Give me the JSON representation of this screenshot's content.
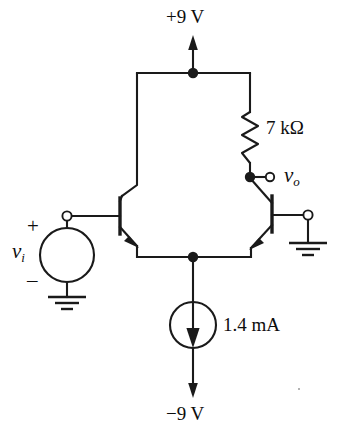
{
  "figure": {
    "type": "circuit-schematic",
    "background_color": "#ffffff",
    "line_color": "#1a1a1a"
  },
  "labels": {
    "supply_positive": "+9 V",
    "supply_negative": "−9 V",
    "resistor_value": "7 kΩ",
    "current_source_value": "1.4 mA",
    "input_symbol": "v",
    "input_subscript": "i",
    "output_symbol": "v",
    "output_subscript": "o",
    "polarity_plus": "+",
    "polarity_minus": "–"
  },
  "components": [
    {
      "name": "positive-supply-rail",
      "kind": "supply-arrow",
      "label": "+9 V",
      "direction": "up"
    },
    {
      "name": "load-resistor",
      "kind": "resistor",
      "label": "7 kΩ",
      "orientation": "vertical"
    },
    {
      "name": "transistor-q1",
      "kind": "npn-bjt",
      "position": "left"
    },
    {
      "name": "transistor-q2",
      "kind": "npn-bjt",
      "position": "right"
    },
    {
      "name": "input-voltage-source",
      "kind": "voltage-source",
      "label": "v_i",
      "polarity_top": "+",
      "polarity_bottom": "–"
    },
    {
      "name": "tail-current-source",
      "kind": "current-source",
      "label": "1.4 mA",
      "direction": "down"
    },
    {
      "name": "negative-supply-rail",
      "kind": "supply-arrow",
      "label": "−9 V",
      "direction": "down"
    },
    {
      "name": "output-terminal",
      "kind": "terminal",
      "label": "v_o"
    },
    {
      "name": "source-ground",
      "kind": "ground"
    },
    {
      "name": "base-ground",
      "kind": "ground"
    }
  ],
  "nodes": [
    {
      "name": "top-supply-node",
      "x": 193,
      "y": 73
    },
    {
      "name": "output-node",
      "x": 250,
      "y": 177
    },
    {
      "name": "tail-node",
      "x": 193,
      "y": 257
    }
  ]
}
